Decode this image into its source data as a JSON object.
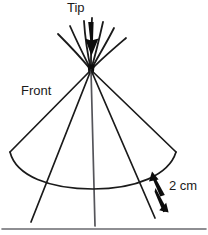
{
  "figure": {
    "type": "line-drawing",
    "background_color": "#ffffff",
    "stroke_color": "#1a1a1a",
    "width": 208,
    "height": 235
  },
  "labels": {
    "tip": "Tip",
    "front": "Front",
    "measure": "2 cm"
  },
  "annotations": {
    "tip_arrow": "down-arrow-to-apex",
    "measure_arrow": "double-headed-arrow",
    "measure_value": "2 cm"
  },
  "geometry": {
    "apex": {
      "x": 91,
      "y": 70
    },
    "arc_left": {
      "x": 10,
      "y": 152
    },
    "arc_right": {
      "x": 176,
      "y": 152
    },
    "arc_bottom_y": 189,
    "baseline_y": 229
  },
  "icons": {
    "tip_arrow": "arrow-down-icon",
    "measure_arrow": "double-arrow-icon"
  }
}
